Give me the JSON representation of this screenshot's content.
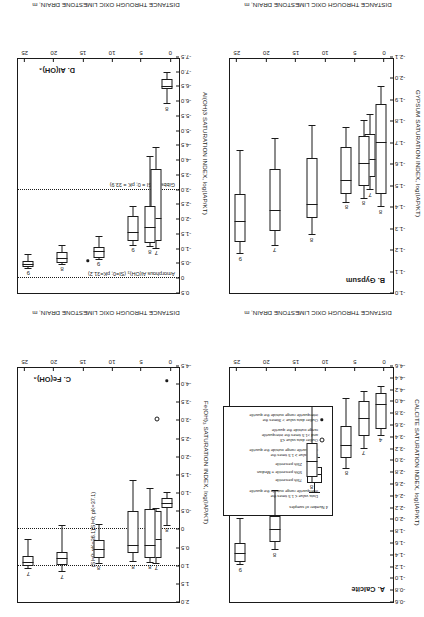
{
  "figure": {
    "shared_xlabel": "DISTANCE THROUGH OXIC LIMESTONE DRAIN, m",
    "x_ticks": [
      "0",
      "5",
      "10",
      "15",
      "20",
      "25"
    ],
    "orientation_note": "figure printed upside down"
  },
  "legend": {
    "title": "",
    "n_label": "4",
    "entries": [
      "4   Number of samples",
      "Data value ≤ 1.5 times the\ninterquartile range outside the quartile",
      "75th percentile",
      "50th percentile = Median",
      "25th percentile",
      "Data value ≥ 1.5 times the\ninterquartile range outside the quartile",
      "Outlier data value ≤3\nand >1.5 times the interquartile\nrange outside the quartile",
      "Outlier data value > 3times the\ninterquartile range outside the quartile"
    ]
  },
  "chart_data": [
    {
      "type": "box",
      "panel": "A",
      "title": "A. Calcite",
      "xlabel": "DISTANCE THROUGH OXIC LIMESTONE DRAIN, m",
      "ylabel": "CALCITE SATURATION INDEX, log(IAP/KT)",
      "xlim": [
        -1.5,
        26.5
      ],
      "ylim": [
        -4.6,
        -0.6
      ],
      "y_ticks": [
        "-0.6",
        "-0.8",
        "-1.0",
        "-1.2",
        "-1.4",
        "-1.6",
        "-1.8",
        "-2.0",
        "-2.2",
        "-2.4",
        "-2.6",
        "-2.8",
        "-3.0",
        "-3.2",
        "-3.4",
        "-3.6",
        "-3.8",
        "-4.0",
        "-4.2",
        "-4.4",
        "-4.6"
      ],
      "grid": false,
      "boxes": [
        {
          "x": 0.6,
          "n": "4",
          "low": -4.24,
          "q1": -4.14,
          "median": -3.94,
          "q3": -3.54,
          "high": -3.42
        },
        {
          "x": 3.5,
          "n": "7",
          "low": -4.16,
          "q1": -4.0,
          "median": -3.7,
          "q3": -3.42,
          "high": -3.2
        },
        {
          "x": 6.4,
          "n": "8",
          "low": -4.04,
          "q1": -3.58,
          "median": -3.24,
          "q3": -3.04,
          "high": -2.86
        },
        {
          "x": 12.3,
          "n": "8",
          "low": -3.9,
          "q1": -3.3,
          "median": -2.98,
          "q3": -2.72,
          "high": -2.62
        },
        {
          "x": 18.6,
          "n": "8",
          "low": -2.48,
          "q1": -2.06,
          "median": -1.82,
          "q3": -1.62,
          "high": -1.48
        },
        {
          "x": 24.4,
          "n": "9",
          "low": -2.0,
          "q1": -1.6,
          "median": -1.42,
          "q3": -1.28,
          "high": -1.22
        }
      ],
      "outliers": []
    },
    {
      "type": "box",
      "panel": "B",
      "title": "B. Gypsum",
      "xlabel": "DISTANCE THROUGH OXIC LIMESTONE DRAIN, m",
      "ylabel": "GYPSUM SATURATION INDEX, log(IAP/KT)",
      "xlim": [
        -1.5,
        26.5
      ],
      "ylim": [
        -2.1,
        -1.0
      ],
      "y_ticks": [
        "-1.0",
        "-1.1",
        "-1.2",
        "-1.3",
        "-1.4",
        "-1.5",
        "-1.6",
        "-1.7",
        "-1.8",
        "-1.9",
        "-2.0",
        "-2.1"
      ],
      "grid": false,
      "boxes": [
        {
          "x": 0.6,
          "n": "8",
          "low": -1.96,
          "q1": -1.88,
          "median": -1.7,
          "q3": -1.46,
          "high": -1.4
        },
        {
          "x": 2.4,
          "n": "7",
          "low": -1.83,
          "q1": -1.74,
          "median": -1.62,
          "q3": -1.54,
          "high": -1.48
        },
        {
          "x": 3.5,
          "n": "8",
          "low": -1.8,
          "q1": -1.73,
          "median": -1.6,
          "q3": -1.5,
          "high": -1.44
        },
        {
          "x": 6.4,
          "n": "8",
          "low": -1.77,
          "q1": -1.68,
          "median": -1.52,
          "q3": -1.46,
          "high": -1.42
        },
        {
          "x": 12.3,
          "n": "8",
          "low": -1.78,
          "q1": -1.63,
          "median": -1.41,
          "q3": -1.35,
          "high": -1.27
        },
        {
          "x": 18.6,
          "n": "7",
          "low": -1.72,
          "q1": -1.58,
          "median": -1.38,
          "q3": -1.29,
          "high": -1.22
        },
        {
          "x": 24.4,
          "n": "9",
          "low": -1.66,
          "q1": -1.46,
          "median": -1.33,
          "q3": -1.24,
          "high": -1.18
        }
      ],
      "outliers": []
    },
    {
      "type": "box",
      "panel": "C",
      "title": "C. Fe(OH)₃",
      "xlabel": "DISTANCE THROUGH OXIC LIMESTONE DRAIN, m",
      "ylabel": "Fe(OH)₃ SATURATION INDEX, log(IAP/KT)",
      "xlim": [
        -1.5,
        26.5
      ],
      "ylim": [
        -4.5,
        2.0
      ],
      "y_ticks": [
        "2.0",
        "1.5",
        "1.0",
        "0.5",
        "0",
        "-0.5",
        "-1.0",
        "-1.5",
        "-2.0",
        "-2.5",
        "-3.0",
        "-3.5",
        "-4.0",
        "-4.5"
      ],
      "grid": false,
      "reference_lines": [
        {
          "value": 1.0,
          "label": "(SI=0; pK=36.1)"
        },
        {
          "value": 0.0,
          "label": "(SI=0; pK=37.1)"
        }
      ],
      "boxes": [
        {
          "x": 0.6,
          "n": "8",
          "low": -1.0,
          "q1": -0.86,
          "median": -0.7,
          "q3": -0.58,
          "high": -0.1
        },
        {
          "x": 2.4,
          "n": "7",
          "low": -0.55,
          "q1": -0.5,
          "median": 0.3,
          "q3": 0.8,
          "high": 0.95
        },
        {
          "x": 3.5,
          "n": "8",
          "low": -1.12,
          "q1": -0.55,
          "median": 0.45,
          "q3": 0.8,
          "high": 0.92
        },
        {
          "x": 6.4,
          "n": "8",
          "low": -1.32,
          "q1": -0.5,
          "median": 0.45,
          "q3": 0.66,
          "high": 0.9
        },
        {
          "x": 12.3,
          "n": "8",
          "low": -0.12,
          "q1": 0.3,
          "median": 0.58,
          "q3": 0.8,
          "high": 0.95
        },
        {
          "x": 18.6,
          "n": "7",
          "low": -0.08,
          "q1": 0.62,
          "median": 0.82,
          "q3": 0.98,
          "high": 1.18
        },
        {
          "x": 24.4,
          "n": "7",
          "low": 0.3,
          "q1": 0.72,
          "median": 0.92,
          "q3": 1.02,
          "high": 1.1
        }
      ],
      "outliers": [
        {
          "x": 2.2,
          "y": -3.05,
          "kind": "open"
        },
        {
          "x": 0.6,
          "y": -4.1,
          "kind": "filled"
        }
      ]
    },
    {
      "type": "box",
      "panel": "D",
      "title": "D. Al(OH)₃",
      "xlabel": "DISTANCE THROUGH OXIC LIMESTONE DRAIN, m",
      "ylabel": "Al(OH)3 SATURATION INDEX, log(IAP/KT)",
      "xlim": [
        -1.5,
        26.5
      ],
      "ylim": [
        -7.5,
        0.5
      ],
      "y_ticks": [
        "0.5",
        "0",
        "-0.5",
        "-1.0",
        "-1.5",
        "-2.0",
        "-2.5",
        "-3.0",
        "-3.5",
        "-4.0",
        "-4.5",
        "-5.0",
        "-5.5",
        "-6.0",
        "-6.5",
        "-7.0",
        "-7.5"
      ],
      "grid": false,
      "reference_lines": [
        {
          "value": 0.0,
          "label": "Amorphous Al(OH)₃ (SI=0; pK=31.2)"
        },
        {
          "value": -3.0,
          "label": "Gibbsite (SI = 0; pK = 33.9)"
        }
      ],
      "boxes": [
        {
          "x": 0.6,
          "n": "8",
          "low": -6.95,
          "q1": -6.75,
          "median": -6.48,
          "q3": -6.4,
          "high": -5.9
        },
        {
          "x": 2.4,
          "n": "7",
          "low": -4.4,
          "q1": -3.7,
          "median": -2.0,
          "q3": -1.25,
          "high": -1.0
        },
        {
          "x": 3.5,
          "n": "8",
          "low": -4.1,
          "q1": -2.45,
          "median": -1.7,
          "q3": -1.2,
          "high": -1.05
        },
        {
          "x": 6.4,
          "n": "9",
          "low": -2.4,
          "q1": -2.1,
          "median": -1.55,
          "q3": -1.25,
          "high": -1.1
        },
        {
          "x": 12.3,
          "n": "9",
          "low": -1.4,
          "q1": -1.05,
          "median": -0.88,
          "q3": -0.7,
          "high": -0.62
        },
        {
          "x": 18.6,
          "n": "8",
          "low": -1.1,
          "q1": -0.9,
          "median": -0.65,
          "q3": -0.52,
          "high": -0.46
        },
        {
          "x": 24.4,
          "n": "9",
          "low": -0.8,
          "q1": -0.58,
          "median": -0.46,
          "q3": -0.38,
          "high": -0.32
        }
      ],
      "outliers": [
        {
          "x": 14.2,
          "y": -0.6,
          "kind": "filled"
        }
      ]
    }
  ]
}
